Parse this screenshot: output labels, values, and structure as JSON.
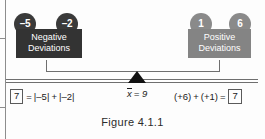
{
  "figure": {
    "caption": "Figure 4.1.1",
    "colors": {
      "negative_fill": "#333333",
      "positive_fill": "#848484",
      "negative_circle": "#3a3a3a",
      "positive_circle": "#8a8a8a",
      "beam": "#6f6f6f",
      "fulcrum": "#111111"
    }
  },
  "negative_side": {
    "box_label_line1": "Negative",
    "box_label_line2": "Deviations",
    "circles": [
      {
        "value": "–5"
      },
      {
        "value": "–2"
      }
    ],
    "equation": {
      "result": "7",
      "equals": "=",
      "term1": "|–5|",
      "plus": "+",
      "term2": "|–2|"
    }
  },
  "positive_side": {
    "box_label_line1": "Positive",
    "box_label_line2": "Deviations",
    "circles": [
      {
        "value": "1"
      },
      {
        "value": "6"
      }
    ],
    "equation": {
      "term1": "(+6)",
      "plus": "+",
      "term2": "(+1)",
      "equals": "=",
      "result": "7"
    }
  },
  "center": {
    "mean_symbol": "x",
    "mean_equals": "= 9"
  }
}
